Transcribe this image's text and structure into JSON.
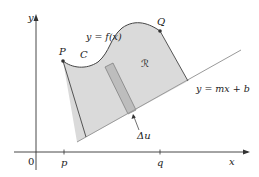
{
  "figure": {
    "type": "rotation-volume-region-diagram",
    "axes": {
      "x_label": "x",
      "y_label": "y",
      "origin_label": "0",
      "x_ticks": [
        "p",
        "q"
      ]
    },
    "curve": {
      "equation_label": "y = f(x)",
      "curve_name": "C",
      "start_point": "P",
      "end_point": "Q"
    },
    "line": {
      "equation_label": "y = mx + b"
    },
    "region": {
      "label": "ℛ"
    },
    "strip": {
      "label": "Δu"
    },
    "colors": {
      "region_fill": "#dadada",
      "strip_fill": "#bdbdbd",
      "axis": "#333333",
      "line": "#9a9a9a",
      "curve": "#444444"
    }
  }
}
